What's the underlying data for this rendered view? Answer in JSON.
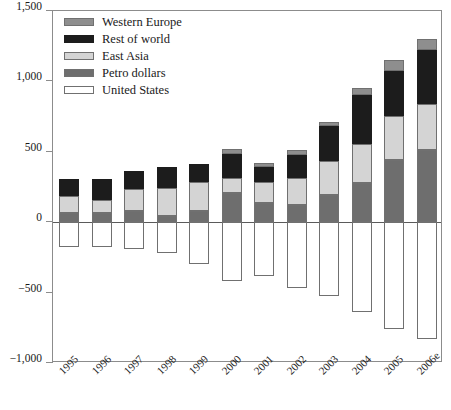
{
  "chart_data": {
    "type": "bar",
    "stacked": true,
    "title": "",
    "subtitle": "",
    "xlabel": "",
    "ylabel": "",
    "grid": false,
    "legend_position": "top-left",
    "categories": [
      "1995",
      "1996",
      "1997",
      "1998",
      "1999",
      "2000",
      "2001",
      "2002",
      "2003",
      "2004",
      "2005",
      "2006e"
    ],
    "ylim": [
      -1000,
      1500
    ],
    "yticks": [
      -1000,
      -500,
      0,
      500,
      1000,
      1500
    ],
    "ytick_labels": [
      "−1,000",
      "−500",
      "0",
      "500",
      "1,000",
      "1,500"
    ],
    "series": [
      {
        "name": "United States",
        "color": "#ffffff",
        "values": [
          -174,
          -174,
          -188,
          -222,
          -299,
          -417,
          -385,
          -465,
          -521,
          -639,
          -757,
          -833
        ]
      },
      {
        "name": "Petro dollars",
        "color": "#6e6e6e",
        "values": [
          63,
          63,
          76,
          42,
          76,
          208,
          139,
          125,
          194,
          278,
          444,
          514
        ]
      },
      {
        "name": "East Asia",
        "color": "#d4d4d4",
        "values": [
          125,
          97,
          160,
          201,
          208,
          104,
          146,
          188,
          243,
          278,
          313,
          326
        ]
      },
      {
        "name": "Rest of world",
        "color": "#1c1c1c",
        "values": [
          118,
          146,
          125,
          146,
          132,
          174,
          104,
          167,
          243,
          347,
          319,
          382
        ]
      },
      {
        "name": "Western Europe",
        "color": "#8e8e8e",
        "values": [
          0,
          0,
          0,
          0,
          0,
          35,
          35,
          35,
          35,
          49,
          76,
          76
        ]
      }
    ],
    "positive_totals": [
      306,
      306,
      361,
      389,
      416,
      521,
      424,
      515,
      715,
      952,
      1152,
      1298
    ]
  },
  "legend": {
    "items": [
      {
        "label": "Western Europe",
        "swatch": "we"
      },
      {
        "label": "Rest of world",
        "swatch": "row"
      },
      {
        "label": "East Asia",
        "swatch": "ea"
      },
      {
        "label": "Petro dollars",
        "swatch": "pd"
      },
      {
        "label": "United States",
        "swatch": "us"
      }
    ]
  }
}
